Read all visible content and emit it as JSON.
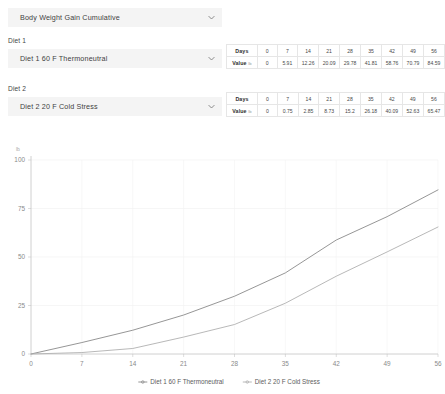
{
  "metric_select": {
    "value": "Body Weight Gain Cumulative",
    "chevron_icon": "chevron-down-icon"
  },
  "diet1": {
    "group_label": "Diet 1",
    "value": "Diet 1  60 F Thermoneutral",
    "chevron_icon": "chevron-down-icon"
  },
  "diet2": {
    "group_label": "Diet 2",
    "value": "Diet 2  20 F Cold Stress",
    "chevron_icon": "chevron-down-icon"
  },
  "table1": {
    "days_label": "Days",
    "value_label": "Value",
    "value_unit": "lb",
    "days": [
      "0",
      "7",
      "14",
      "21",
      "28",
      "35",
      "42",
      "49",
      "56"
    ],
    "values": [
      "0",
      "5.91",
      "12.26",
      "20.09",
      "29.78",
      "41.81",
      "58.76",
      "70.79",
      "84.59"
    ]
  },
  "table2": {
    "days_label": "Days",
    "value_label": "Value",
    "value_unit": "lb",
    "days": [
      "0",
      "7",
      "14",
      "21",
      "28",
      "35",
      "42",
      "49",
      "56"
    ],
    "values": [
      "0",
      "0.75",
      "2.85",
      "8.73",
      "15.2",
      "26.18",
      "40.09",
      "52.63",
      "65.47"
    ]
  },
  "chart_data": {
    "type": "line",
    "title": "",
    "xlabel": "",
    "ylabel": "",
    "y_unit": "lb",
    "x": [
      0,
      7,
      14,
      21,
      28,
      35,
      42,
      49,
      56
    ],
    "xticks": [
      0,
      7,
      14,
      21,
      28,
      35,
      42,
      49,
      56
    ],
    "yticks": [
      0,
      25,
      50,
      75,
      100
    ],
    "xlim": [
      0,
      56
    ],
    "ylim": [
      0,
      100
    ],
    "grid": true,
    "legend_position": "bottom",
    "series": [
      {
        "name": "Diet 1 60 F Thermoneutral",
        "color": "#8a8a8a",
        "marker": "line-marker",
        "values": [
          0,
          5.91,
          12.26,
          20.09,
          29.78,
          41.81,
          58.76,
          70.79,
          84.59
        ]
      },
      {
        "name": "Diet 2 20 F Cold Stress",
        "color": "#b0b0b0",
        "marker": "line-marker",
        "values": [
          0,
          0.75,
          2.85,
          8.73,
          15.2,
          26.18,
          40.09,
          52.63,
          65.47
        ]
      }
    ]
  }
}
